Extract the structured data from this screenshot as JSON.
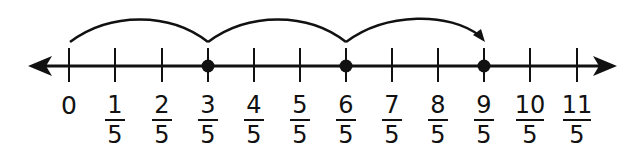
{
  "diagram": {
    "type": "number_line",
    "colors": {
      "line": "#111111",
      "background": "#ffffff"
    },
    "ticks": [
      {
        "value": "0",
        "whole": "0"
      },
      {
        "value": "1/5",
        "num": "1",
        "den": "5"
      },
      {
        "value": "2/5",
        "num": "2",
        "den": "5"
      },
      {
        "value": "3/5",
        "num": "3",
        "den": "5"
      },
      {
        "value": "4/5",
        "num": "4",
        "den": "5"
      },
      {
        "value": "5/5",
        "num": "5",
        "den": "5"
      },
      {
        "value": "6/5",
        "num": "6",
        "den": "5"
      },
      {
        "value": "7/5",
        "num": "7",
        "den": "5"
      },
      {
        "value": "8/5",
        "num": "8",
        "den": "5"
      },
      {
        "value": "9/5",
        "num": "9",
        "den": "5"
      },
      {
        "value": "10/5",
        "num": "10",
        "den": "5"
      },
      {
        "value": "11/5",
        "num": "11",
        "den": "5"
      }
    ],
    "points": [
      "3/5",
      "6/5",
      "9/5"
    ],
    "jumps": [
      {
        "from": "0",
        "to": "3/5"
      },
      {
        "from": "3/5",
        "to": "6/5"
      },
      {
        "from": "6/5",
        "to": "9/5",
        "arrowhead": true
      }
    ]
  }
}
